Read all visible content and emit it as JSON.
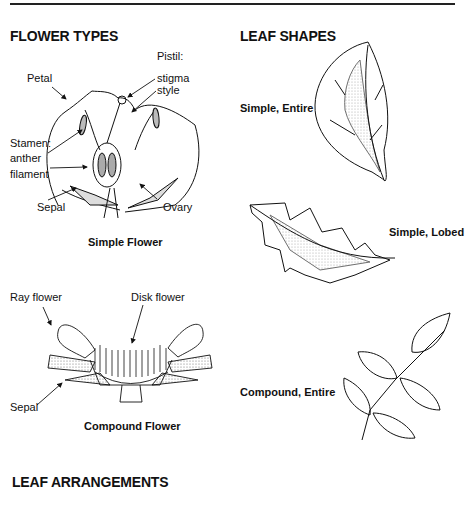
{
  "sections": {
    "flower_types": "FLOWER TYPES",
    "leaf_shapes": "LEAF SHAPES",
    "leaf_arrangements": "LEAF ARRANGEMENTS"
  },
  "simple_flower": {
    "caption": "Simple Flower",
    "labels": {
      "petal": "Petal",
      "pistil": "Pistil:",
      "stigma": "stigma",
      "style": "style",
      "stamen": "Stamen:",
      "anther": "anther",
      "filament": "filament",
      "sepal": "Sepal",
      "ovary": "Ovary"
    }
  },
  "compound_flower": {
    "caption": "Compound Flower",
    "labels": {
      "ray_flower": "Ray flower",
      "disk_flower": "Disk flower",
      "sepal": "Sepal"
    }
  },
  "leaves": [
    {
      "label": "Simple, Entire"
    },
    {
      "label": "Simple, Lobed"
    },
    {
      "label": "Compound, Entire"
    }
  ]
}
